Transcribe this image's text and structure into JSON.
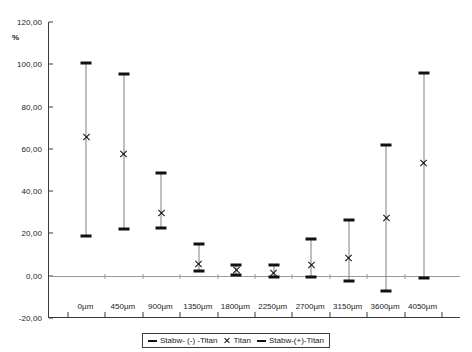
{
  "chart_data": {
    "type": "scatter",
    "title": "",
    "xlabel": "",
    "ylabel": "%",
    "ylim": [
      -20,
      120
    ],
    "ytick_labels": [
      "120,00",
      "100,00",
      "80,00",
      "60,00",
      "40,00",
      "20,00",
      "0,00",
      "-20,00"
    ],
    "ytick_values": [
      120,
      100,
      80,
      60,
      40,
      20,
      0,
      -20
    ],
    "grid": false,
    "legend_position": "bottom-center",
    "categories": [
      "0µm",
      "450µm",
      "900µm",
      "1350µm",
      "1800µm",
      "2250µm",
      "2700µm",
      "3150µm",
      "3600µm",
      "4050µm"
    ],
    "series": [
      {
        "name": "Stabw- (-) -Titan",
        "marker": "dash",
        "values": [
          19.0,
          22.0,
          22.5,
          2.0,
          0.5,
          -0.5,
          -0.5,
          -2.5,
          -7.0,
          -1.0
        ]
      },
      {
        "name": "Titan",
        "marker": "x",
        "values": [
          65.5,
          57.5,
          29.5,
          5.5,
          2.5,
          1.5,
          5.0,
          8.5,
          27.5,
          53.5
        ]
      },
      {
        "name": "Stabw-(+)-Titan",
        "marker": "dash",
        "values": [
          100.5,
          95.5,
          48.5,
          15.0,
          5.0,
          5.0,
          17.5,
          26.5,
          62.0,
          96.0
        ]
      }
    ]
  },
  "legend": {
    "items": [
      {
        "label": "Stabw- (-) -Titan",
        "marker": "dash"
      },
      {
        "label": "Titan",
        "marker": "x"
      },
      {
        "label": "Stabw-(+)-Titan",
        "marker": "dash"
      }
    ]
  }
}
